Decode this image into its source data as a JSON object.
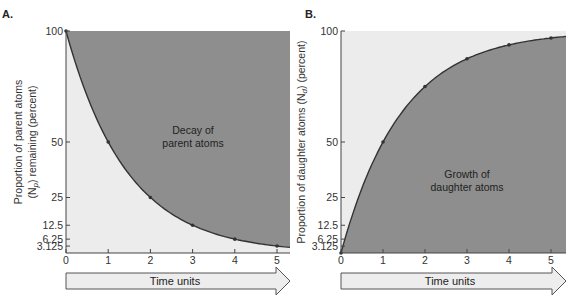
{
  "colors": {
    "light_fill": "#ececec",
    "dark_fill": "#8e8e8e",
    "curve": "#333333",
    "arrow_fill": "#ededed",
    "arrow_stroke": "#555555"
  },
  "panels": {
    "a": {
      "label": "A.",
      "ylabel_line1": "Proportion of parent atoms",
      "ylabel_line2_pre": "(N",
      "ylabel_line2_sub": "p",
      "ylabel_line2_post": ") remaining (percent)",
      "area_label_line1": "Decay of",
      "area_label_line2": "parent atoms",
      "arrow_label": "Time units"
    },
    "b": {
      "label": "B.",
      "ylabel_pre": "Proportion of daughter atoms (N",
      "ylabel_sub": "d",
      "ylabel_post": ") (percent)",
      "area_label_line1": "Growth of",
      "area_label_line2": "daughter atoms",
      "arrow_label": "Time units"
    }
  },
  "axis": {
    "x_ticks": [
      "0",
      "1",
      "2",
      "3",
      "4",
      "5"
    ],
    "y_ticks": [
      "100",
      "50",
      "25",
      "12.5",
      "6.25",
      "3.125"
    ]
  },
  "chart_data": [
    {
      "type": "line",
      "title": "A. Decay of parent atoms",
      "xlabel": "Time units",
      "ylabel": "Proportion of parent atoms (Np) remaining (percent)",
      "x": [
        0,
        1,
        2,
        3,
        4,
        5
      ],
      "series": [
        {
          "name": "Parent atoms remaining",
          "values": [
            100,
            50,
            25,
            12.5,
            6.25,
            3.125
          ]
        }
      ],
      "x_ticks": [
        0,
        1,
        2,
        3,
        4,
        5
      ],
      "y_ticks": [
        100,
        50,
        25,
        12.5,
        6.25,
        3.125
      ],
      "xlim": [
        0,
        5.3
      ],
      "ylim": [
        0,
        100
      ],
      "grid": false,
      "annotations": [
        "Decay of parent atoms"
      ]
    },
    {
      "type": "line",
      "title": "B. Growth of daughter atoms",
      "xlabel": "Time units",
      "ylabel": "Proportion of daughter atoms (Nd) (percent)",
      "x": [
        0,
        1,
        2,
        3,
        4,
        5
      ],
      "series": [
        {
          "name": "Daughter atoms",
          "values": [
            0,
            50,
            75,
            87.5,
            93.75,
            96.875
          ]
        }
      ],
      "x_ticks": [
        0,
        1,
        2,
        3,
        4,
        5
      ],
      "y_ticks": [
        100,
        50,
        25,
        12.5,
        6.25,
        3.125
      ],
      "xlim": [
        0,
        5.3
      ],
      "ylim": [
        0,
        100
      ],
      "grid": false,
      "annotations": [
        "Growth of daughter atoms"
      ]
    }
  ]
}
